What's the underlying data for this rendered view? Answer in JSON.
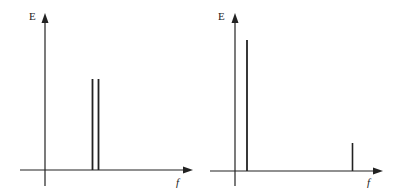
{
  "diagrams": [
    {
      "name": "spectrum-left",
      "y_label": "E",
      "x_label": "f",
      "description": "Two closely spaced equal-height spectral lines",
      "lines": [
        {
          "f_pos": 92,
          "height": 79
        },
        {
          "f_pos": 98,
          "height": 79
        }
      ]
    },
    {
      "name": "spectrum-right",
      "y_label": "E",
      "x_label": "f",
      "description": "One tall low-frequency line and one short high-frequency line",
      "lines": [
        {
          "f_pos": 247,
          "height": 40
        },
        {
          "f_pos": 352,
          "height": 143
        }
      ]
    }
  ],
  "colors": {
    "ink": "#222222",
    "background": "#ffffff"
  }
}
